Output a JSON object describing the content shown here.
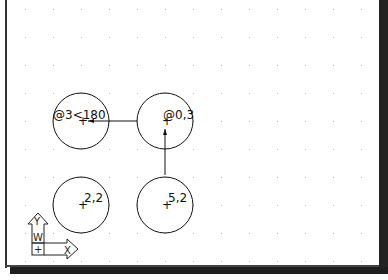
{
  "app": "CAD drawing viewport",
  "drawing": {
    "grid": {
      "columns": 13,
      "rows": 10,
      "dot_color": "#b8b8b8"
    },
    "circles": [
      {
        "id": "circle-polar",
        "label": "@3<180",
        "col": 2,
        "row": 4
      },
      {
        "id": "circle-relative",
        "label": "@0,3",
        "col": 5,
        "row": 4
      },
      {
        "id": "circle-absolute-2-2",
        "label": "2,2",
        "col": 2,
        "row": 7
      },
      {
        "id": "circle-absolute-5-2",
        "label": "5,2",
        "col": 5,
        "row": 7
      }
    ],
    "arrows": [
      {
        "id": "arrow-up",
        "direction": "up",
        "from": "5,2",
        "to": "@0,3"
      },
      {
        "id": "arrow-left",
        "direction": "left",
        "from": "@0,3",
        "to": "@3<180"
      }
    ],
    "ucs_icon": {
      "x_label": "X",
      "y_label": "Y",
      "w_label": "W",
      "origin_mark": "+"
    },
    "line_color": "#111111"
  }
}
